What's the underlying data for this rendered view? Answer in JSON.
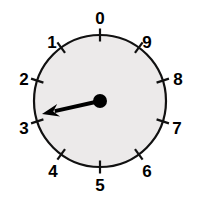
{
  "widget": {
    "type": "analog-dial-gauge",
    "title": "",
    "face_color": "#eceaea",
    "outline_color": "#111111",
    "needle_color": "#000000",
    "background_color": "#ffffff"
  },
  "dial": {
    "center_x": 100,
    "center_y": 101,
    "radius": 66,
    "label_radius": 81,
    "tick_count": 10,
    "tick_step_degrees": 36,
    "direction": "counterclockwise",
    "ticks": [
      {
        "label": "0",
        "angle_deg": 0,
        "label_x": 100,
        "label_y": 20
      },
      {
        "label": "1",
        "angle_deg": 36,
        "label_x": 52,
        "label_y": 44
      },
      {
        "label": "2",
        "angle_deg": 72,
        "label_x": 24,
        "label_y": 81
      },
      {
        "label": "3",
        "angle_deg": 108,
        "label_x": 24,
        "label_y": 130
      },
      {
        "label": "4",
        "angle_deg": 144,
        "label_x": 53,
        "label_y": 173
      },
      {
        "label": "5",
        "angle_deg": 180,
        "label_x": 100,
        "label_y": 187
      },
      {
        "label": "6",
        "angle_deg": 216,
        "label_x": 147,
        "label_y": 173
      },
      {
        "label": "7",
        "angle_deg": 252,
        "label_x": 177,
        "label_y": 130
      },
      {
        "label": "8",
        "angle_deg": 288,
        "label_x": 178,
        "label_y": 81
      },
      {
        "label": "9",
        "angle_deg": 324,
        "label_x": 147,
        "label_y": 44
      }
    ]
  },
  "needle": {
    "value": "2.5",
    "angle_deg": 193,
    "hub_x": 100,
    "hub_y": 101,
    "hub_radius": 7,
    "tip_x": 42,
    "tip_y": 114,
    "shaft_width": 4
  }
}
